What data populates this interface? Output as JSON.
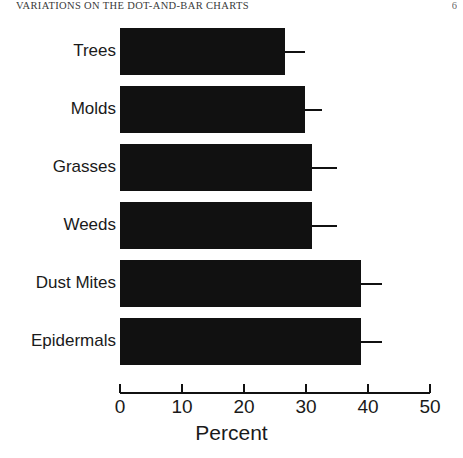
{
  "header": {
    "running_head": "VARIATIONS ON THE DOT-AND-BAR CHARTS",
    "page_number": "6"
  },
  "chart_data": {
    "type": "bar",
    "orientation": "horizontal",
    "title": "",
    "xlabel": "Percent",
    "ylabel": "",
    "xlim": [
      0,
      50
    ],
    "xticks": [
      0,
      10,
      20,
      30,
      40,
      50
    ],
    "xtick_labels": [
      "0",
      "10",
      "20",
      "30",
      "40",
      "50"
    ],
    "grid": false,
    "legend": false,
    "bar_color": "#111111",
    "categories": [
      "Trees",
      "Molds",
      "Grasses",
      "Weeds",
      "Dust Mites",
      "Epidermals"
    ],
    "values": [
      26.6,
      29.8,
      31.0,
      31.0,
      38.8,
      38.8
    ],
    "error_high": [
      29.8,
      32.6,
      35.0,
      35.0,
      42.2,
      42.2
    ],
    "series": [
      {
        "name": "Percent",
        "values": [
          26.6,
          29.8,
          31.0,
          31.0,
          38.8,
          38.8
        ]
      }
    ],
    "bars": [
      {
        "label": "Trees",
        "value": 26.6,
        "error_high": 29.8
      },
      {
        "label": "Molds",
        "value": 29.8,
        "error_high": 32.6
      },
      {
        "label": "Grasses",
        "value": 31.0,
        "error_high": 35.0
      },
      {
        "label": "Weeds",
        "value": 31.0,
        "error_high": 35.0
      },
      {
        "label": "Dust Mites",
        "value": 38.8,
        "error_high": 42.2
      },
      {
        "label": "Epidermals",
        "value": 38.8,
        "error_high": 42.2
      }
    ]
  }
}
